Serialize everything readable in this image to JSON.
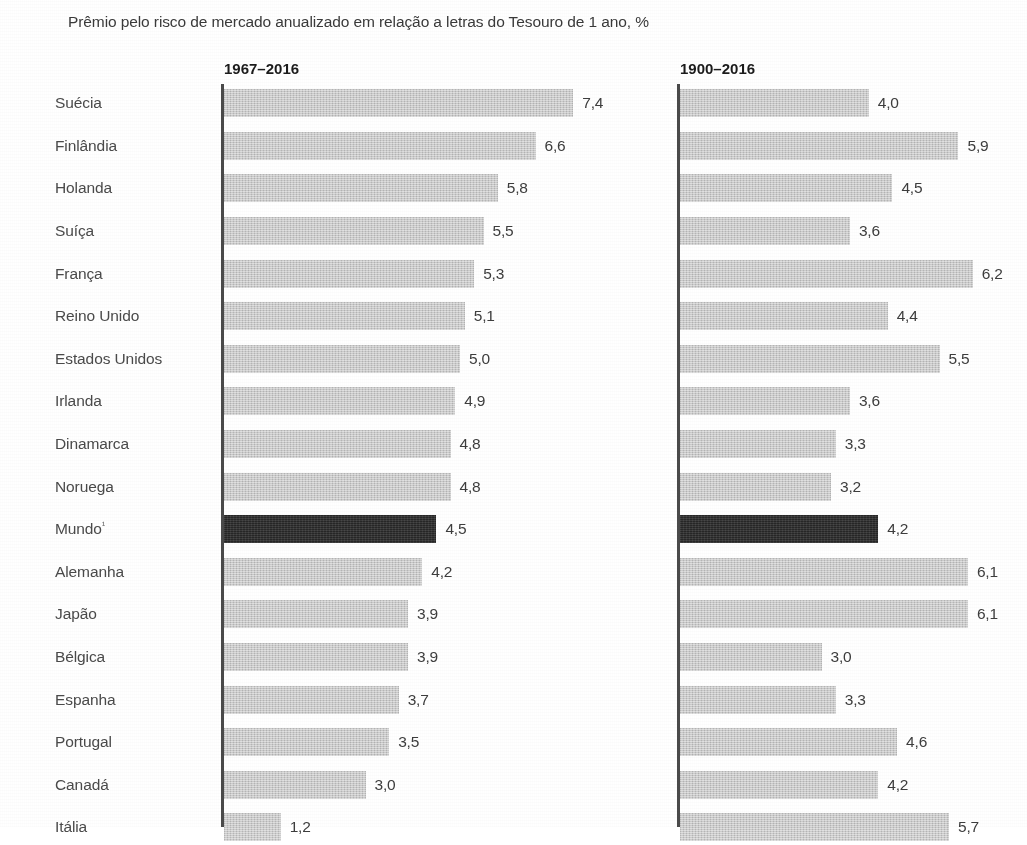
{
  "chart_data": {
    "type": "bar",
    "orientation": "horizontal",
    "title": "Prêmio pelo risco de mercado anualizado em relação a letras do Tesouro de 1 ano, %",
    "xlabel": "",
    "ylabel": "",
    "grid": false,
    "legend_position": "none",
    "value_label_format": "decimal-comma",
    "xlim": [
      0,
      7.4
    ],
    "categories": [
      "Suécia",
      "Finlândia",
      "Holanda",
      "Suíça",
      "França",
      "Reino Unido",
      "Estados Unidos",
      "Irlanda",
      "Dinamarca",
      "Noruega",
      "Mundo¹",
      "Alemanha",
      "Japão",
      "Bélgica",
      "Espanha",
      "Portugal",
      "Canadá",
      "Itália"
    ],
    "series": [
      {
        "name": "1967–2016",
        "values": [
          7.4,
          6.6,
          5.8,
          5.5,
          5.3,
          5.1,
          5.0,
          4.9,
          4.8,
          4.8,
          4.5,
          4.2,
          3.9,
          3.9,
          3.7,
          3.5,
          3.0,
          1.2
        ],
        "labels": [
          "7,4",
          "6,6",
          "5,8",
          "5,5",
          "5,3",
          "5,1",
          "5,0",
          "4,9",
          "4,8",
          "4,8",
          "4,5",
          "4,2",
          "3,9",
          "3,9",
          "3,7",
          "3,5",
          "3,0",
          "1,2"
        ]
      },
      {
        "name": "1900–2016",
        "values": [
          4.0,
          5.9,
          4.5,
          3.6,
          6.2,
          4.4,
          5.5,
          3.6,
          3.3,
          3.2,
          4.2,
          6.1,
          6.1,
          3.0,
          3.3,
          4.6,
          4.2,
          5.7
        ],
        "labels": [
          "4,0",
          "5,9",
          "4,5",
          "3,6",
          "6,2",
          "4,4",
          "5,5",
          "3,6",
          "3,3",
          "3,2",
          "4,2",
          "6,1",
          "6,1",
          "3,0",
          "3,3",
          "4,6",
          "4,2",
          "5,7"
        ]
      }
    ],
    "highlight_category": "Mundo¹",
    "colors": {
      "bar": "#c5c5c5",
      "bar_highlight": "#2f2f2f",
      "axis": "#4a4a4a",
      "text": "#4a4a4a",
      "header_text": "#1b1b1b",
      "background": "#ffffff"
    }
  },
  "panels": [
    {
      "header": "1967–2016"
    },
    {
      "header": "1900–2016"
    }
  ]
}
